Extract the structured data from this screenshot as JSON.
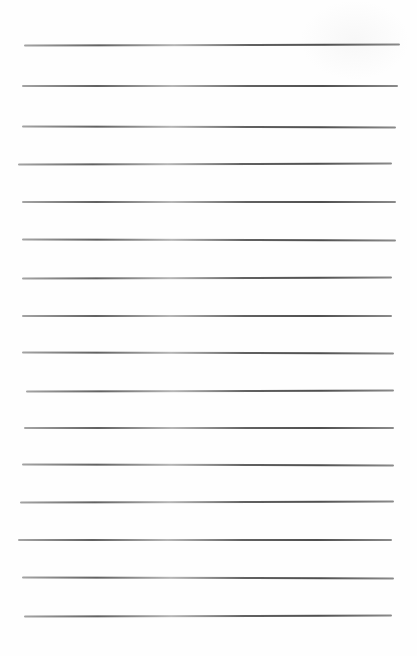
{
  "page": {
    "type": "blank lined sheet",
    "background": "#fefefe",
    "line_color": "#555555",
    "rules": [
      {
        "y": 45,
        "x1": 24,
        "x2": 400
      },
      {
        "y": 86,
        "x1": 22,
        "x2": 398
      },
      {
        "y": 127,
        "x1": 22,
        "x2": 396
      },
      {
        "y": 164,
        "x1": 18,
        "x2": 392
      },
      {
        "y": 202,
        "x1": 22,
        "x2": 396
      },
      {
        "y": 240,
        "x1": 22,
        "x2": 396
      },
      {
        "y": 278,
        "x1": 22,
        "x2": 392
      },
      {
        "y": 316,
        "x1": 22,
        "x2": 392
      },
      {
        "y": 353,
        "x1": 22,
        "x2": 394
      },
      {
        "y": 391,
        "x1": 26,
        "x2": 394
      },
      {
        "y": 428,
        "x1": 24,
        "x2": 394
      },
      {
        "y": 465,
        "x1": 22,
        "x2": 394
      },
      {
        "y": 502,
        "x1": 20,
        "x2": 394
      },
      {
        "y": 540,
        "x1": 18,
        "x2": 392
      },
      {
        "y": 578,
        "x1": 22,
        "x2": 394
      },
      {
        "y": 616,
        "x1": 24,
        "x2": 392
      }
    ]
  }
}
